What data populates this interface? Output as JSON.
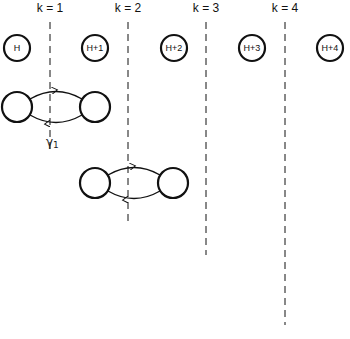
{
  "diagram": {
    "columns": [
      {
        "label": "k = 1",
        "x": 50
      },
      {
        "label": "k = 2",
        "x": 128
      },
      {
        "label": "k = 3",
        "x": 206
      },
      {
        "label": "k = 4",
        "x": 285
      }
    ],
    "top_nodes": [
      {
        "label": "H",
        "cx": 17
      },
      {
        "label": "H+1",
        "cx": 95
      },
      {
        "label": "H+2",
        "cx": 174
      },
      {
        "label": "H+3",
        "cx": 252
      },
      {
        "label": "H+4",
        "cx": 330
      }
    ],
    "loops": [
      {
        "label": "γ₁",
        "left": 17,
        "right": 95,
        "cy": 107,
        "dash_x": 50
      },
      {
        "label": "γ₂",
        "left": 95,
        "right": 173,
        "cy": 183,
        "dash_x": 128
      },
      {
        "label": "γ₃",
        "left": 173,
        "right": 252,
        "cy": 230,
        "dash_x": 206
      },
      {
        "label": "γ₄",
        "left": 252,
        "right": 330,
        "cy": 300,
        "dash_x": 285
      }
    ],
    "gamma_labels": [
      "γ1",
      "γ2",
      "γ3",
      "γ4"
    ]
  }
}
